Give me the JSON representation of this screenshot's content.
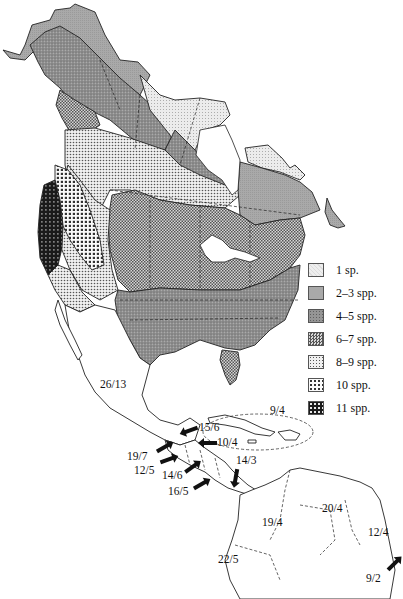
{
  "figure": {
    "legend": {
      "items": [
        {
          "label": "1 sp.",
          "pattern": "light-stipple",
          "color": "#e4e4e4"
        },
        {
          "label": "2–3 spp.",
          "pattern": "medium-gray",
          "color": "#a8a8a8"
        },
        {
          "label": "4–5 spp.",
          "pattern": "dark-stipple",
          "color": "#8c8c8c"
        },
        {
          "label": "6–7 spp.",
          "pattern": "fine-checker",
          "color": "#9a9a9a"
        },
        {
          "label": "8–9 spp.",
          "pattern": "dotted-grid",
          "color": "#c8c8c8"
        },
        {
          "label": "10 spp.",
          "pattern": "open-grid",
          "color": "#bdbdbd"
        },
        {
          "label": "11 spp.",
          "pattern": "dense-grid",
          "color": "#2a2a2a"
        }
      ]
    },
    "region_labels": [
      {
        "id": "mexico",
        "text": "26/13"
      },
      {
        "id": "greater-antilles",
        "text": "9/4"
      },
      {
        "id": "belize",
        "text": "15/6"
      },
      {
        "id": "honduras-coast",
        "text": "10/4"
      },
      {
        "id": "guatemala-pacific",
        "text": "19/7"
      },
      {
        "id": "el-salvador",
        "text": "12/5"
      },
      {
        "id": "nicaragua",
        "text": "14/6"
      },
      {
        "id": "costa-rica",
        "text": "16/5"
      },
      {
        "id": "panama",
        "text": "14/3"
      },
      {
        "id": "colombia",
        "text": "19/4"
      },
      {
        "id": "venezuela",
        "text": "20/4"
      },
      {
        "id": "guyana",
        "text": "12/4"
      },
      {
        "id": "ecuador",
        "text": "22/5"
      },
      {
        "id": "suriname-coast",
        "text": "9/2"
      }
    ]
  }
}
